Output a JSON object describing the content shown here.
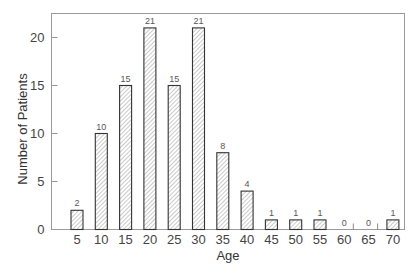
{
  "chart_data": {
    "type": "bar",
    "title": "",
    "xlabel": "Age",
    "ylabel": "Number of Patients",
    "categories": [
      "5",
      "10",
      "15",
      "20",
      "25",
      "30",
      "35",
      "40",
      "45",
      "50",
      "55",
      "60",
      "65",
      "70"
    ],
    "values": [
      2,
      10,
      15,
      21,
      15,
      21,
      8,
      4,
      1,
      1,
      1,
      0,
      0,
      1
    ],
    "data_labels": [
      "2",
      "10",
      "15",
      "21",
      "15",
      "21",
      "8",
      "4",
      "1",
      "1",
      "1",
      "0",
      "0",
      "1"
    ],
    "yticks": [
      0,
      5,
      10,
      15,
      20
    ],
    "ylim": [
      0,
      22.5
    ],
    "grid": false,
    "legend": null,
    "bar_style": "diagonal-hatched",
    "colors": {
      "bar_stroke": "#333333",
      "hatch": "#888888",
      "axis": "#999999",
      "text": "#444444"
    }
  }
}
